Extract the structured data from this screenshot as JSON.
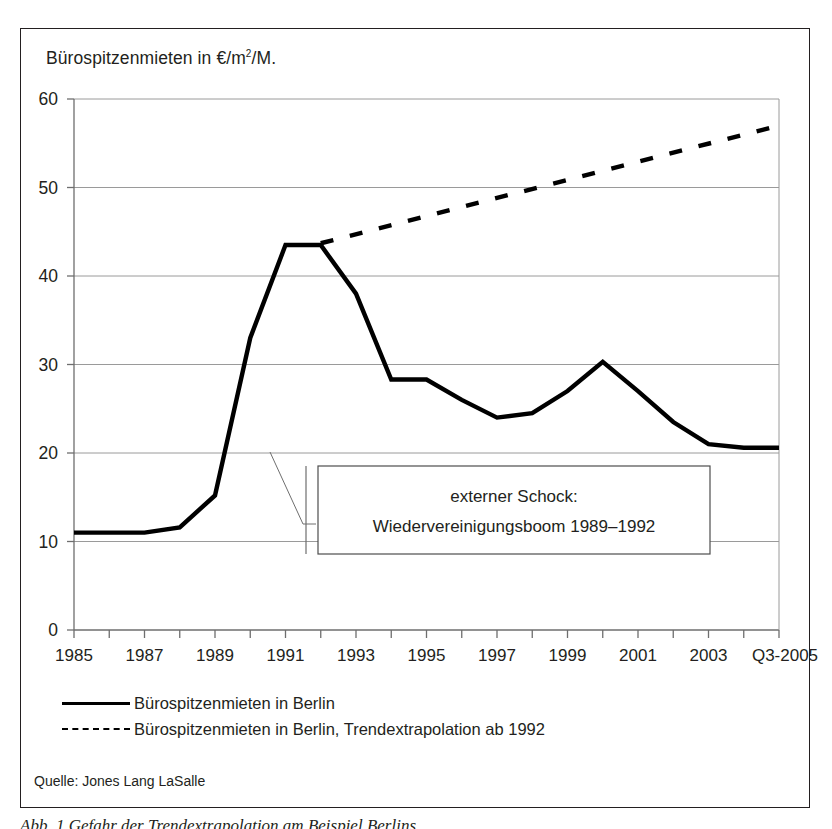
{
  "figure": {
    "title_main": "Bürospitzenmieten in €/m",
    "title_sup": "2",
    "title_tail": "/M.",
    "source": "Quelle: Jones Lang LaSalle",
    "caption": "Abb. 1    Gefahr der Trendextrapolation am Beispiel Berlins",
    "annotation_line1": "externer Schock:",
    "annotation_line2": "Wiedervereinigungsboom 1989–1992",
    "legend": [
      {
        "key": "solid",
        "label": "Bürospitzenmieten in Berlin"
      },
      {
        "key": "dashed",
        "label": "Bürospitzenmieten in Berlin, Trendextrapolation ab 1992"
      }
    ],
    "colors": {
      "line": "#000000",
      "grid": "#9a9a9a",
      "axis": "#6e6e6e",
      "frame": "#231f20",
      "text": "#231f20",
      "background": "#ffffff"
    }
  },
  "chart_data": {
    "type": "line",
    "xlabel": "",
    "ylabel": "Bürospitzenmieten in €/m²/M.",
    "ylim": [
      0,
      60
    ],
    "yticks": [
      0,
      10,
      20,
      30,
      40,
      50,
      60
    ],
    "ytick_labels": [
      "0",
      "10",
      "20",
      "30",
      "40",
      "50",
      "60"
    ],
    "grid": true,
    "legend_position": "below-axes",
    "x": [
      1985,
      1986,
      1987,
      1988,
      1989,
      1990,
      1991,
      1992,
      1993,
      1994,
      1995,
      1996,
      1997,
      1998,
      1999,
      2000,
      2001,
      2002,
      2003,
      2004,
      2005
    ],
    "xtick_labels": [
      "1985",
      "",
      "1987",
      "",
      "1989",
      "",
      "1991",
      "",
      "1993",
      "",
      "1995",
      "",
      "1997",
      "",
      "1999",
      "",
      "2001",
      "",
      "2003",
      "",
      "Q3-2005"
    ],
    "xtick_labels_shown": [
      "1985",
      "1987",
      "1989",
      "1991",
      "1993",
      "1995",
      "1997",
      "1999",
      "2001",
      "2003",
      "Q3-2005"
    ],
    "series": [
      {
        "name": "Bürospitzenmieten in Berlin",
        "style": "solid",
        "values": [
          11.0,
          11.0,
          11.0,
          11.6,
          15.2,
          33.0,
          43.5,
          43.5,
          38.0,
          28.3,
          28.3,
          26.0,
          24.0,
          24.5,
          27.0,
          30.3,
          27.0,
          23.5,
          21.0,
          20.6,
          20.6
        ]
      },
      {
        "name": "Bürospitzenmieten in Berlin, Trendextrapolation ab 1992",
        "style": "dashed",
        "x": [
          1992,
          2005
        ],
        "values": [
          43.7,
          57.0
        ]
      }
    ],
    "annotations": [
      {
        "text": "externer Schock: Wiedervereinigungsboom 1989–1992",
        "span_start": 1989,
        "span_end": 1992
      }
    ]
  }
}
